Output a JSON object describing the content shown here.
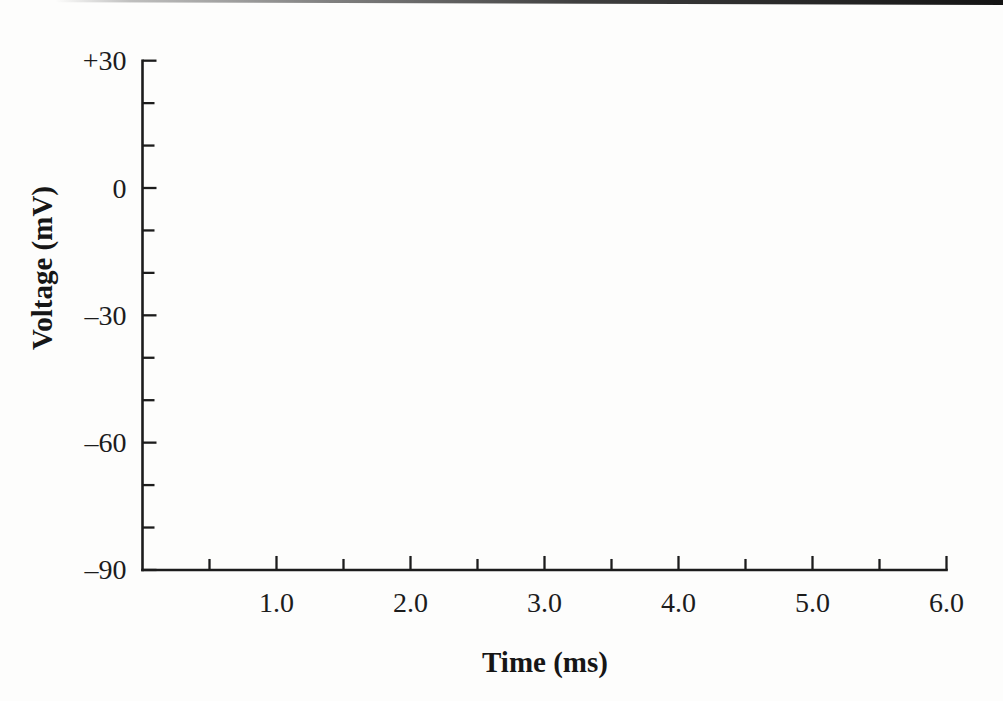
{
  "figure": {
    "background": "#fdfdfc",
    "ink_color": "#1c1c1c"
  },
  "chart_data": {
    "type": "line",
    "title": "",
    "xlabel": "Time (ms)",
    "ylabel": "Voltage (mV)",
    "xlim": [
      0,
      6
    ],
    "ylim": [
      -90,
      30
    ],
    "x_major_ticks": [
      1,
      2,
      3,
      4,
      5,
      6
    ],
    "x_major_tick_labels": [
      "1.0",
      "2.0",
      "3.0",
      "4.0",
      "5.0",
      "6.0"
    ],
    "x_minor_tick_step": 0.5,
    "y_major_ticks": [
      30,
      0,
      -30,
      -60,
      -90
    ],
    "y_major_tick_labels": [
      "+30",
      "0",
      "–30",
      "–60",
      "–90"
    ],
    "y_minor_tick_step": 10,
    "grid": "off",
    "legend": "none",
    "series": []
  }
}
